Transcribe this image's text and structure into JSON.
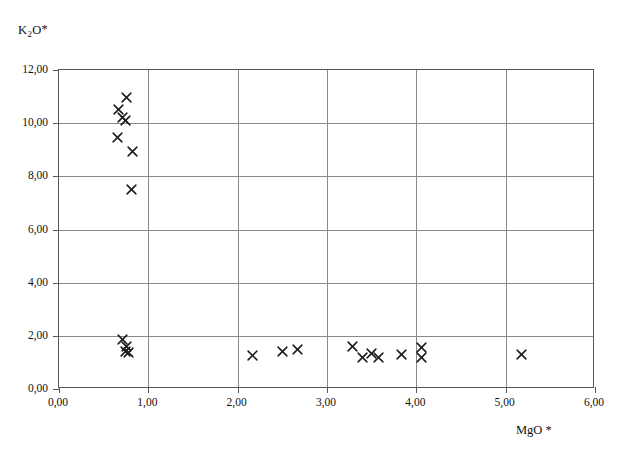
{
  "chart_data": {
    "type": "scatter",
    "title": "",
    "xlabel": "MgO *",
    "ylabel": "K2O*",
    "ylabel_rich": {
      "prefix": "K",
      "sub": "2",
      "mid": "O",
      "star": "*"
    },
    "xlim": [
      0.0,
      6.0
    ],
    "ylim": [
      0.0,
      12.0
    ],
    "xticks": [
      0.0,
      1.0,
      2.0,
      3.0,
      4.0,
      5.0,
      6.0
    ],
    "yticks": [
      0.0,
      2.0,
      4.0,
      6.0,
      8.0,
      10.0,
      12.0
    ],
    "xtick_labels": [
      "0,00",
      "1,00",
      "2,00",
      "3,00",
      "4,00",
      "5,00",
      "6,00"
    ],
    "ytick_labels": [
      "0,00",
      "2,00",
      "4,00",
      "6,00",
      "8,00",
      "10,00",
      "12,00"
    ],
    "decimal_separator": ",",
    "grid": true,
    "grid_color": "#85888c",
    "frame_color": "#55575a",
    "marker": "x-cross",
    "marker_color": "#1a1a1a",
    "legend": null,
    "series": [
      {
        "name": "samples",
        "points": [
          {
            "x": 0.75,
            "y": 10.95
          },
          {
            "x": 0.67,
            "y": 10.52
          },
          {
            "x": 0.71,
            "y": 10.22
          },
          {
            "x": 0.74,
            "y": 10.1
          },
          {
            "x": 0.66,
            "y": 9.45
          },
          {
            "x": 0.82,
            "y": 8.95
          },
          {
            "x": 0.81,
            "y": 7.5
          },
          {
            "x": 0.71,
            "y": 1.88
          },
          {
            "x": 0.76,
            "y": 1.58
          },
          {
            "x": 0.74,
            "y": 1.42
          },
          {
            "x": 0.78,
            "y": 1.36
          },
          {
            "x": 2.17,
            "y": 1.25
          },
          {
            "x": 2.5,
            "y": 1.42
          },
          {
            "x": 2.67,
            "y": 1.5
          },
          {
            "x": 3.28,
            "y": 1.58
          },
          {
            "x": 3.4,
            "y": 1.2
          },
          {
            "x": 3.5,
            "y": 1.32
          },
          {
            "x": 3.58,
            "y": 1.18
          },
          {
            "x": 3.83,
            "y": 1.28
          },
          {
            "x": 4.06,
            "y": 1.55
          },
          {
            "x": 4.06,
            "y": 1.18
          },
          {
            "x": 5.18,
            "y": 1.28
          }
        ]
      }
    ]
  }
}
